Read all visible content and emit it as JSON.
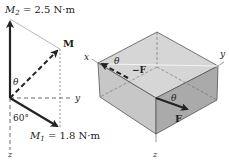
{
  "left_diagram": {
    "m2_label": "M",
    "m2_sub": "2",
    "m2_value": " = 2.5 N·m",
    "m1_label": "M",
    "m1_sub": "1",
    "m1_value": " = 1.8 N·m",
    "resultant_label": "M",
    "theta": "θ",
    "angle": "60°",
    "axis_y": "y",
    "axis_z": "z",
    "axis_x": "x"
  },
  "right_diagram": {
    "axis_x": "x",
    "axis_y": "y",
    "axis_z": "z",
    "theta_top": "θ",
    "theta_front": "θ",
    "neg_force": "−F",
    "force": "F"
  },
  "colors": {
    "top_face": "#d4d4d4",
    "left_face": "#c4c4c4",
    "right_face": "#a9a9a9",
    "ink": "#222222"
  }
}
